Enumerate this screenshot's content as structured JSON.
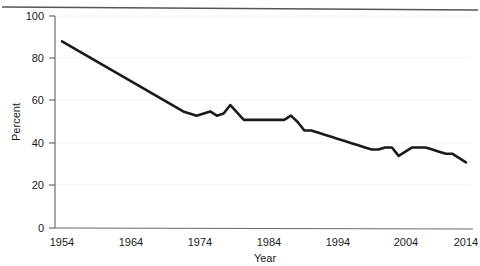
{
  "figure": {
    "top_rule": true,
    "background_color": "#ffffff",
    "line_color": "#1a1a1a",
    "axis_color": "#6b6b6b",
    "grid_color": "#f0f0f0",
    "text_color": "#1a1a1a"
  },
  "chart_data": {
    "type": "line",
    "title": "",
    "subtitle": "",
    "xlabel": "Year",
    "ylabel": "Percent",
    "xlim": [
      1954,
      2014
    ],
    "ylim": [
      0,
      100
    ],
    "xticks": [
      1954,
      1964,
      1974,
      1984,
      1994,
      2004,
      2014
    ],
    "xtick_labels": [
      "1954",
      "1964",
      "1974",
      "1984",
      "1994",
      "2004",
      "2014"
    ],
    "yticks": [
      0,
      20,
      40,
      60,
      80,
      100
    ],
    "ytick_labels": [
      "0",
      "20",
      "40",
      "60",
      "80",
      "100"
    ],
    "grid": "horizontal",
    "legend": "none",
    "annotations": [],
    "series": [
      {
        "name": "Percent",
        "color": "#1a1a1a",
        "x": [
          1954,
          1972,
          1974,
          1976,
          1977,
          1978,
          1979,
          1981,
          1983,
          1985,
          1986,
          1987,
          1988,
          1989,
          1990,
          1991,
          1992,
          1993,
          1994,
          1995,
          1996,
          1997,
          1998,
          1999,
          2000,
          2001,
          2002,
          2003,
          2004,
          2005,
          2006,
          2007,
          2008,
          2009,
          2010,
          2011,
          2012,
          2013,
          2014
        ],
        "values": [
          88,
          55,
          53,
          55,
          53,
          54,
          58,
          51,
          51,
          51,
          51,
          51,
          53,
          50,
          46,
          46,
          45,
          44,
          43,
          42,
          41,
          40,
          39,
          38,
          37,
          37,
          38,
          38,
          34,
          36,
          38,
          38,
          38,
          37,
          36,
          35,
          35,
          33,
          31
        ]
      }
    ]
  }
}
